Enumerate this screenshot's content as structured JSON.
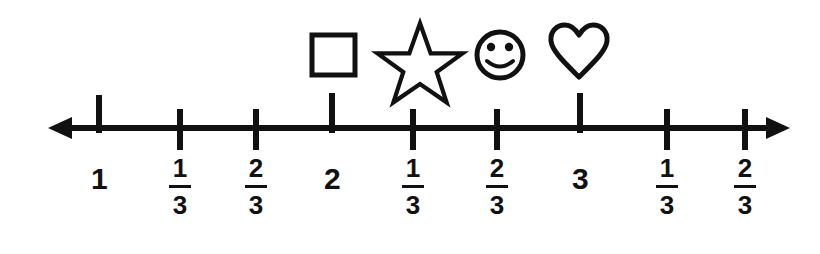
{
  "figure": {
    "type": "number-line",
    "title": "",
    "background_color": "#ffffff",
    "ink_color": "#111111"
  },
  "numberline": {
    "axis_y": 128,
    "left_arrow_x": 48,
    "right_arrow_x": 790,
    "line_thickness": 6,
    "whole_tick_style": "tall-upward",
    "fraction_tick_style": "centered",
    "ticks": [
      {
        "label_text": "1",
        "kind": "whole",
        "x": 99,
        "value": "1"
      },
      {
        "label_text": "1/3",
        "kind": "fraction",
        "x": 180,
        "value": "1 1/3",
        "numerator": "1",
        "denominator": "3"
      },
      {
        "label_text": "2/3",
        "kind": "fraction",
        "x": 256,
        "value": "1 2/3",
        "numerator": "2",
        "denominator": "3"
      },
      {
        "label_text": "2",
        "kind": "whole",
        "x": 332,
        "value": "2"
      },
      {
        "label_text": "1/3",
        "kind": "fraction",
        "x": 413,
        "value": "2 1/3",
        "numerator": "1",
        "denominator": "3"
      },
      {
        "label_text": "2/3",
        "kind": "fraction",
        "x": 497,
        "value": "2 2/3",
        "numerator": "2",
        "denominator": "3"
      },
      {
        "label_text": "3",
        "kind": "whole",
        "x": 580,
        "value": "3"
      },
      {
        "label_text": "1/3",
        "kind": "fraction",
        "x": 667,
        "value": "3 1/3",
        "numerator": "1",
        "denominator": "3"
      },
      {
        "label_text": "2/3",
        "kind": "fraction",
        "x": 745,
        "value": "3 2/3",
        "numerator": "2",
        "denominator": "3"
      }
    ],
    "labels": {
      "whole": [
        {
          "text": "1",
          "x": 99
        },
        {
          "text": "2",
          "x": 332
        },
        {
          "text": "3",
          "x": 580
        }
      ],
      "fractions": [
        {
          "numerator": "1",
          "denominator": "3",
          "x": 180
        },
        {
          "numerator": "2",
          "denominator": "3",
          "x": 256
        },
        {
          "numerator": "1",
          "denominator": "3",
          "x": 413
        },
        {
          "numerator": "2",
          "denominator": "3",
          "x": 497
        },
        {
          "numerator": "1",
          "denominator": "3",
          "x": 667
        },
        {
          "numerator": "2",
          "denominator": "3",
          "x": 745
        }
      ]
    }
  },
  "markers": [
    {
      "icon": "square-icon",
      "name": "square",
      "x": 333,
      "y": 55,
      "marks_tick_x": 332,
      "marks_value": "2"
    },
    {
      "icon": "star-icon",
      "name": "star",
      "x": 420,
      "y": 49,
      "marks_tick_x": 413,
      "marks_value": "2 1/3"
    },
    {
      "icon": "smiley-icon",
      "name": "smiley",
      "x": 500,
      "y": 55,
      "marks_tick_x": 497,
      "marks_value": "2 2/3"
    },
    {
      "icon": "heart-icon",
      "name": "heart",
      "x": 579,
      "y": 52,
      "marks_tick_x": 580,
      "marks_value": "3"
    }
  ]
}
